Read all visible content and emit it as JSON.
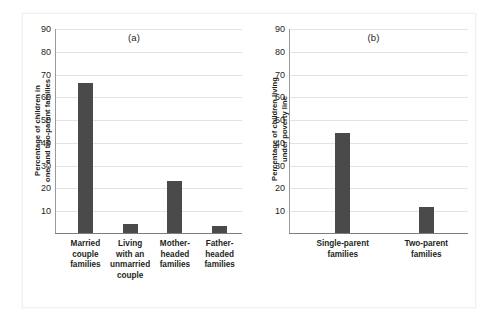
{
  "figure": {
    "panels": [
      {
        "id": "a",
        "title": "(a)",
        "ylabel": "Percentage of children in\none- and two-parent families"
      },
      {
        "id": "b",
        "title": "(b)",
        "ylabel": "Percentage of children living\nunder poverty line"
      }
    ]
  },
  "chart_data": [
    {
      "type": "bar",
      "title": "(a)",
      "xlabel": "",
      "ylabel": "Percentage of children in one- and two-parent families",
      "ylim": [
        0,
        90
      ],
      "yticks": [
        10,
        20,
        30,
        40,
        50,
        60,
        70,
        80,
        90
      ],
      "ytick_labels": [
        "10",
        "20",
        "30",
        "40",
        "50",
        "60",
        "70",
        "80",
        "90"
      ],
      "grid": true,
      "legend": "none",
      "bar_color": "#4a4a4a",
      "categories": [
        "Married\ncouple\nfamilies",
        "Living\nwith an\nunmarried\ncouple",
        "Mother-\nheaded\nfamilies",
        "Father-\nheaded\nfamilies"
      ],
      "values": [
        66,
        4,
        23,
        3
      ]
    },
    {
      "type": "bar",
      "title": "(b)",
      "xlabel": "",
      "ylabel": "Percentage of children living under poverty line",
      "ylim": [
        0,
        90
      ],
      "yticks": [
        10,
        20,
        30,
        40,
        50,
        60,
        70,
        80,
        90
      ],
      "ytick_labels": [
        "10",
        "20",
        "30",
        "40",
        "50",
        "60",
        "70",
        "80",
        "90"
      ],
      "grid": true,
      "legend": "none",
      "bar_color": "#4a4a4a",
      "categories": [
        "Single-parent\nfamilies",
        "Two-parent\nfamilies"
      ],
      "values": [
        44,
        11.5
      ]
    }
  ]
}
